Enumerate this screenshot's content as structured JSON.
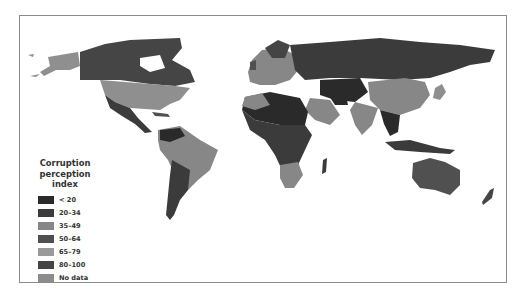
{
  "figure": {
    "type": "choropleth world map",
    "colors": {
      "frame": "#8a8a8a",
      "ocean": "#ffffff"
    }
  },
  "legend": {
    "title_line1": "Corruption",
    "title_line2": "perception index",
    "items": [
      {
        "label": "< 20",
        "color": "#2a2a2a"
      },
      {
        "label": "20–34",
        "color": "#3b3b3b"
      },
      {
        "label": "35–49",
        "color": "#878787"
      },
      {
        "label": "50–64",
        "color": "#505050"
      },
      {
        "label": "65–79",
        "color": "#9a9a9a"
      },
      {
        "label": "80–100",
        "color": "#454545"
      },
      {
        "label": "No data",
        "color": "#8c8c8c"
      }
    ]
  },
  "regions": [
    {
      "name": "Alaska/USA",
      "category": "65–79"
    },
    {
      "name": "Canada",
      "category": "80–100"
    },
    {
      "name": "USA",
      "category": "65–79"
    },
    {
      "name": "Mexico / Central America",
      "category": "20–34"
    },
    {
      "name": "South America north (Brazil)",
      "category": "35–49"
    },
    {
      "name": "Southern Cone",
      "category": "20–34"
    },
    {
      "name": "Greenland",
      "category": "No data"
    },
    {
      "name": "Europe west/north",
      "category": "65–79"
    },
    {
      "name": "Russia",
      "category": "20–34"
    },
    {
      "name": "North Africa / Sahara",
      "category": "< 20"
    },
    {
      "name": "Sub-Saharan Africa",
      "category": "20–34"
    },
    {
      "name": "Southern Africa",
      "category": "35–49"
    },
    {
      "name": "Middle East / Arabia",
      "category": "35–49"
    },
    {
      "name": "Central Asia",
      "category": "< 20"
    },
    {
      "name": "China",
      "category": "35–49"
    },
    {
      "name": "India",
      "category": "35–49"
    },
    {
      "name": "Southeast Asia",
      "category": "20–34"
    },
    {
      "name": "Australia",
      "category": "50–64"
    },
    {
      "name": "New Zealand",
      "category": "80–100"
    }
  ]
}
